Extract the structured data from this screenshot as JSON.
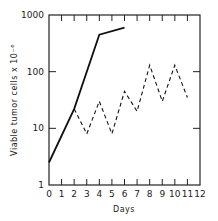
{
  "chart_data": {
    "type": "line",
    "title": "",
    "xlabel": "Days",
    "ylabel": "Viable tumor cells x 10^-6",
    "ylabel_display": "Viable tumor cells x 10⁻⁶",
    "yscale": "log",
    "xlim": [
      0,
      12
    ],
    "ylim": [
      1,
      1000
    ],
    "x_ticks": [
      0,
      1,
      2,
      3,
      4,
      5,
      6,
      7,
      8,
      9,
      10,
      11,
      12
    ],
    "x_tick_labels": [
      "0",
      "1",
      "2",
      "3",
      "4",
      "5",
      "6",
      "7",
      "8",
      "9",
      "10",
      "11",
      "12"
    ],
    "y_ticks": [
      1,
      10,
      100,
      1000
    ],
    "y_tick_labels": [
      "1",
      "10",
      "100",
      "1000"
    ],
    "grid": false,
    "legend": null,
    "series": [
      {
        "name": "untreated growth",
        "style": "solid",
        "x": [
          0,
          2,
          4,
          6
        ],
        "y": [
          2.5,
          22,
          450,
          600
        ]
      },
      {
        "name": "treated cycling",
        "style": "dashed",
        "x": [
          2,
          3,
          4,
          5,
          6,
          7,
          8,
          9,
          10,
          11
        ],
        "y": [
          22,
          8,
          30,
          8,
          45,
          20,
          130,
          30,
          130,
          35
        ]
      }
    ]
  }
}
